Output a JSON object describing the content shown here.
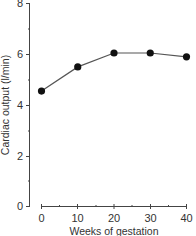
{
  "chart_data": {
    "type": "line",
    "title": "",
    "xlabel": "Weeks of gestation",
    "ylabel": "Cardiac output (l/min)",
    "x": [
      0,
      10,
      20,
      30,
      40
    ],
    "series": [
      {
        "name": "Cardiac output",
        "values": [
          4.55,
          5.5,
          6.05,
          6.05,
          5.9
        ]
      }
    ],
    "xticks": [
      "0",
      "10",
      "20",
      "30",
      "40"
    ],
    "yticks": [
      "0",
      "2",
      "4",
      "6",
      "8"
    ],
    "xlim": [
      0,
      40
    ],
    "ylim": [
      0,
      8
    ],
    "grid": false,
    "legend": null,
    "marker": "filled-circle",
    "line_color": "#555555",
    "marker_color": "#111111"
  }
}
